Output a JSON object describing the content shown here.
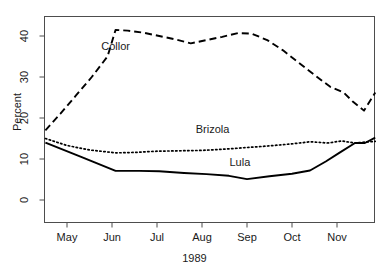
{
  "chart_data": {
    "type": "line",
    "title": "",
    "subtitle": "",
    "xlabel": "1989",
    "ylabel": "Percent",
    "xlim": [
      0,
      8
    ],
    "ylim": [
      0,
      46
    ],
    "grid": false,
    "legend_position": "inline-annotations",
    "x_tick_labels": [
      "May",
      "Jun",
      "Jul",
      "Aug",
      "Sep",
      "Oct",
      "Nov"
    ],
    "x_tick_values": [
      1,
      2,
      3,
      4,
      5,
      6,
      7
    ],
    "y_tick_labels": [
      "0",
      "10",
      "20",
      "30",
      "40"
    ],
    "y_tick_values": [
      0,
      10,
      20,
      30,
      40
    ],
    "series": [
      {
        "name": "Collor",
        "style": "dashed",
        "color": "#000000",
        "label_x": 2.25,
        "label_y": 37.2,
        "x": [
          0.52,
          0.85,
          1.2,
          1.55,
          1.9,
          2.08,
          2.35,
          2.7,
          3.05,
          3.4,
          3.75,
          4.1,
          4.45,
          4.8,
          5.1,
          5.45,
          5.8,
          6.15,
          6.5,
          6.85,
          7.15,
          7.35,
          7.6,
          7.85
        ],
        "values": [
          17.0,
          21.0,
          25.5,
          30.0,
          35.0,
          41.5,
          41.3,
          40.8,
          40.0,
          39.2,
          38.2,
          39.0,
          39.8,
          40.7,
          40.6,
          39.0,
          36.5,
          33.5,
          30.5,
          27.6,
          26.2,
          24.0,
          21.8,
          26.2
        ]
      },
      {
        "name": "Brizola",
        "style": "dotted",
        "color": "#000000",
        "label_x": 4.35,
        "label_y": 17.0,
        "x": [
          0.52,
          1.0,
          1.5,
          2.08,
          2.5,
          3.0,
          3.5,
          4.0,
          4.5,
          5.0,
          5.5,
          6.0,
          6.4,
          6.8,
          7.1,
          7.4,
          7.7,
          7.85
        ],
        "values": [
          15.0,
          13.3,
          12.2,
          11.5,
          11.6,
          11.9,
          12.0,
          12.1,
          12.4,
          12.8,
          13.2,
          13.7,
          14.2,
          13.9,
          14.4,
          13.9,
          14.2,
          14.3
        ]
      },
      {
        "name": "Lula",
        "style": "solid",
        "color": "#000000",
        "label_x": 5.1,
        "label_y": 9.0,
        "x": [
          0.52,
          1.3,
          2.08,
          2.6,
          3.05,
          3.6,
          4.1,
          4.6,
          5.0,
          5.5,
          6.0,
          6.4,
          6.75,
          7.05,
          7.4,
          7.62,
          7.85
        ],
        "values": [
          14.0,
          10.6,
          7.1,
          7.1,
          7.0,
          6.6,
          6.3,
          5.9,
          5.1,
          5.8,
          6.4,
          7.2,
          9.4,
          11.5,
          13.9,
          13.9,
          15.2
        ]
      }
    ]
  },
  "axes": {
    "y_title": "Percent",
    "x_title": "1989"
  }
}
